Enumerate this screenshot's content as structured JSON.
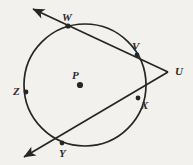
{
  "figure": {
    "kind": "circle-geometry-diagram",
    "background_color": "#f3f1ee",
    "stroke_color": "#262626",
    "label_color": "#2b2b2b",
    "canvas": {
      "width": 193,
      "height": 165
    },
    "circle": {
      "label": "circle-P",
      "cx": 85,
      "cy": 85,
      "r": 61
    },
    "center": {
      "label": "P",
      "x": 80,
      "y": 85
    },
    "points": [
      {
        "label": "W",
        "x": 68,
        "y": 26,
        "marked": true
      },
      {
        "label": "V",
        "x": 137,
        "y": 55,
        "marked": true
      },
      {
        "label": "U",
        "x": 168,
        "y": 72,
        "marked": false
      },
      {
        "label": "X",
        "x": 138,
        "y": 98,
        "marked": true
      },
      {
        "label": "Y",
        "x": 62,
        "y": 143,
        "marked": true
      },
      {
        "label": "Z",
        "x": 26,
        "y": 92,
        "marked": true
      }
    ],
    "secants": [
      {
        "name": "secant-WVU",
        "through": [
          "W",
          "V",
          "U"
        ],
        "arrow_end": {
          "x": 31,
          "y": 8
        }
      },
      {
        "name": "secant-XYU",
        "through": [
          "U",
          "X",
          "Y"
        ],
        "arrow_end": {
          "x": 22,
          "y": 158
        }
      }
    ]
  }
}
